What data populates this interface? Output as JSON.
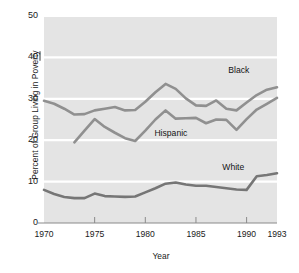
{
  "chart_data": {
    "type": "line",
    "title": "",
    "xlabel": "Year",
    "ylabel": "Percent of Group Living in Poverty",
    "xlim": [
      1970,
      1993
    ],
    "ylim": [
      0,
      50
    ],
    "yticks": [
      0,
      10,
      20,
      30,
      40,
      50
    ],
    "xticks": [
      1970,
      1975,
      1980,
      1985,
      1990,
      1993
    ],
    "grid": "horizontal-white-gridlines",
    "legend": "inline-series-labels",
    "plot_background": "#e4e4e4",
    "gridline_color": "#ffffff",
    "series": [
      {
        "name": "Black",
        "color": "#909090",
        "label_x": 1988.2,
        "label_y": 36.6,
        "x": [
          1970,
          1971,
          1972,
          1973,
          1974,
          1975,
          1976,
          1977,
          1978,
          1979,
          1980,
          1981,
          1982,
          1983,
          1984,
          1985,
          1986,
          1987,
          1988,
          1989,
          1990,
          1991,
          1992,
          1993
        ],
        "values": [
          29.5,
          28.8,
          27.6,
          26.2,
          26.3,
          27.2,
          27.6,
          28.0,
          27.2,
          27.3,
          29.3,
          31.6,
          33.6,
          32.4,
          30.1,
          28.4,
          28.3,
          29.6,
          27.6,
          27.2,
          29.1,
          30.9,
          32.2,
          32.8
        ]
      },
      {
        "name": "Hispanic",
        "color": "#909090",
        "label_x": 1980.9,
        "label_y": 21.5,
        "x": [
          1973,
          1974,
          1975,
          1976,
          1977,
          1978,
          1979,
          1980,
          1981,
          1982,
          1983,
          1984,
          1985,
          1986,
          1987,
          1988,
          1989,
          1990,
          1991,
          1992,
          1993
        ],
        "values": [
          19.5,
          22.3,
          25.1,
          23.2,
          21.8,
          20.5,
          19.8,
          22.3,
          25.0,
          27.2,
          25.2,
          25.3,
          25.4,
          24.1,
          25.0,
          24.9,
          22.5,
          25.1,
          27.4,
          28.8,
          30.2
        ]
      },
      {
        "name": "White",
        "color": "#767676",
        "label_x": 1987.6,
        "label_y": 13.2,
        "x": [
          1970,
          1971,
          1972,
          1973,
          1974,
          1975,
          1976,
          1977,
          1978,
          1979,
          1980,
          1981,
          1982,
          1983,
          1984,
          1985,
          1986,
          1987,
          1988,
          1989,
          1990,
          1991,
          1992,
          1993
        ],
        "values": [
          8.0,
          7.0,
          6.3,
          6.0,
          6.0,
          7.1,
          6.5,
          6.4,
          6.3,
          6.4,
          7.4,
          8.4,
          9.5,
          9.8,
          9.3,
          9.0,
          9.0,
          8.7,
          8.4,
          8.1,
          8.0,
          11.3,
          11.6,
          12.0
        ]
      }
    ]
  }
}
